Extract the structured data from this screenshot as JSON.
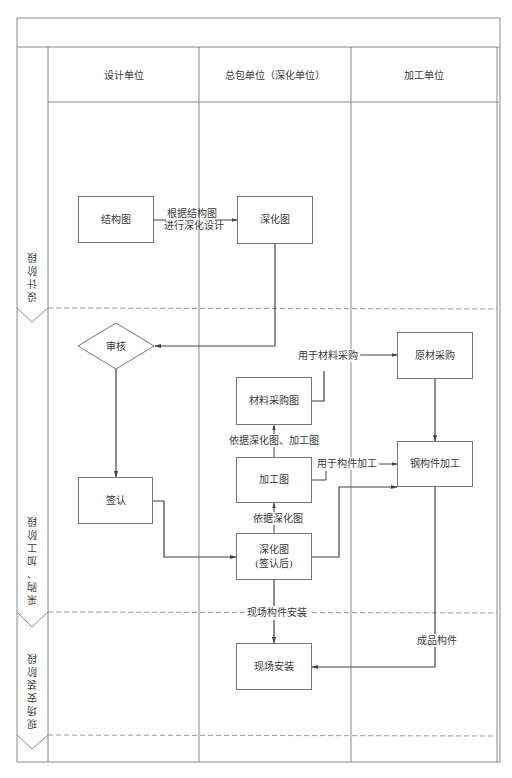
{
  "diagram": {
    "title_band": "",
    "lanes": [
      {
        "id": "design",
        "label": "设计单位"
      },
      {
        "id": "general",
        "label": "总包单位（深化单位）"
      },
      {
        "id": "fab",
        "label": "加工单位"
      }
    ],
    "phases": [
      {
        "id": "design_phase",
        "label": "设计阶段"
      },
      {
        "id": "procure_phase",
        "label": "采购、加工阶段"
      },
      {
        "id": "install_phase",
        "label": "现场安装阶段"
      }
    ],
    "nodes": {
      "structure_drawing": "结构图",
      "detail_drawing": "深化图",
      "review": "审核",
      "raw_material": "原材采购",
      "material_drawing": "材料采购图",
      "process_drawing": "加工图",
      "steel_fab": "钢构件加工",
      "sign_off": "签认",
      "detail_signed_line1": "深化图",
      "detail_signed_line2": "(签认后)",
      "site_install": "现场安装"
    },
    "edge_labels": {
      "based_on_structure_1": "根据结构图",
      "based_on_structure_2": "进行深化设计",
      "for_material": "用于材料采购",
      "based_on_detail_process": "依据深化图、加工图",
      "for_fabrication": "用于构件加工",
      "based_on_detail": "依据深化图",
      "site_component_install": "现场构件安装",
      "finished_component": "成品构件"
    },
    "colors": {
      "line": "#555555",
      "frame": "#8a8a8a",
      "dashed": "#9a9a9a",
      "text": "#3a3a3a"
    }
  }
}
